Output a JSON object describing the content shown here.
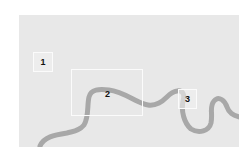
{
  "map": {
    "background_color": "#e8e8e8",
    "river_color": "#a8a8a8",
    "box_border_color": "#fbfbfb",
    "features": [
      {
        "type": "river",
        "name": "river"
      }
    ],
    "zones": [
      {
        "id": "1",
        "label": "1"
      },
      {
        "id": "2",
        "label": "2"
      },
      {
        "id": "3",
        "label": "3"
      }
    ]
  }
}
